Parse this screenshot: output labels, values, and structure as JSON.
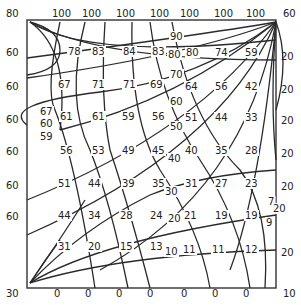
{
  "diagram": {
    "type": "contour-flow-net",
    "corners": {
      "top_left": "80",
      "top_right": "60",
      "bottom_left": "30",
      "bottom_right": "10"
    },
    "top_boundary": [
      "100",
      "100",
      "100",
      "100",
      "100",
      "100",
      "100"
    ],
    "bottom_boundary": [
      "0",
      "0",
      "0",
      "0",
      "0",
      "0",
      "0"
    ],
    "left_boundary": [
      "60",
      "60",
      "60",
      "60",
      "60",
      "60"
    ],
    "right_boundary": [
      "20",
      "20",
      "20",
      "20",
      "20",
      "20"
    ],
    "interior_labels": [
      {
        "t": "78",
        "x": 68,
        "y": 55
      },
      {
        "t": "83",
        "x": 92,
        "y": 55
      },
      {
        "t": "84",
        "x": 123,
        "y": 55
      },
      {
        "t": "83",
        "x": 152,
        "y": 55
      },
      {
        "t": "90",
        "x": 170,
        "y": 40
      },
      {
        "t": "80",
        "x": 168,
        "y": 58
      },
      {
        "t": "80",
        "x": 186,
        "y": 56
      },
      {
        "t": "74",
        "x": 215,
        "y": 56
      },
      {
        "t": "59",
        "x": 245,
        "y": 56
      },
      {
        "t": "67",
        "x": 58,
        "y": 88
      },
      {
        "t": "71",
        "x": 92,
        "y": 88
      },
      {
        "t": "71",
        "x": 123,
        "y": 88
      },
      {
        "t": "69",
        "x": 150,
        "y": 88
      },
      {
        "t": "70",
        "x": 170,
        "y": 78
      },
      {
        "t": "64",
        "x": 185,
        "y": 90
      },
      {
        "t": "56",
        "x": 215,
        "y": 90
      },
      {
        "t": "42",
        "x": 245,
        "y": 90
      },
      {
        "t": "67",
        "x": 40,
        "y": 115
      },
      {
        "t": "61",
        "x": 60,
        "y": 120
      },
      {
        "t": "61",
        "x": 92,
        "y": 120
      },
      {
        "t": "59",
        "x": 122,
        "y": 120
      },
      {
        "t": "56",
        "x": 152,
        "y": 120
      },
      {
        "t": "60",
        "x": 170,
        "y": 105
      },
      {
        "t": "51",
        "x": 185,
        "y": 121
      },
      {
        "t": "44",
        "x": 215,
        "y": 121
      },
      {
        "t": "33",
        "x": 245,
        "y": 121
      },
      {
        "t": "60",
        "x": 40,
        "y": 127
      },
      {
        "t": "59",
        "x": 40,
        "y": 140
      },
      {
        "t": "50",
        "x": 170,
        "y": 130
      },
      {
        "t": "56",
        "x": 60,
        "y": 154
      },
      {
        "t": "53",
        "x": 92,
        "y": 154
      },
      {
        "t": "49",
        "x": 122,
        "y": 154
      },
      {
        "t": "45",
        "x": 152,
        "y": 154
      },
      {
        "t": "40",
        "x": 185,
        "y": 154
      },
      {
        "t": "35",
        "x": 215,
        "y": 154
      },
      {
        "t": "28",
        "x": 245,
        "y": 154
      },
      {
        "t": "40",
        "x": 168,
        "y": 162
      },
      {
        "t": "51",
        "x": 58,
        "y": 187
      },
      {
        "t": "44",
        "x": 88,
        "y": 187
      },
      {
        "t": "39",
        "x": 122,
        "y": 187
      },
      {
        "t": "35",
        "x": 152,
        "y": 187
      },
      {
        "t": "31",
        "x": 185,
        "y": 187
      },
      {
        "t": "27",
        "x": 215,
        "y": 187
      },
      {
        "t": "23",
        "x": 245,
        "y": 187
      },
      {
        "t": "30",
        "x": 165,
        "y": 195
      },
      {
        "t": "7",
        "x": 268,
        "y": 205
      },
      {
        "t": "20",
        "x": 273,
        "y": 212
      },
      {
        "t": "44",
        "x": 58,
        "y": 219
      },
      {
        "t": "34",
        "x": 88,
        "y": 219
      },
      {
        "t": "28",
        "x": 120,
        "y": 219
      },
      {
        "t": "24",
        "x": 150,
        "y": 219
      },
      {
        "t": "20",
        "x": 168,
        "y": 222
      },
      {
        "t": "21",
        "x": 184,
        "y": 219
      },
      {
        "t": "19",
        "x": 215,
        "y": 219
      },
      {
        "t": "19",
        "x": 245,
        "y": 219
      },
      {
        "t": "9",
        "x": 266,
        "y": 226
      },
      {
        "t": "31",
        "x": 58,
        "y": 250
      },
      {
        "t": "20",
        "x": 88,
        "y": 250
      },
      {
        "t": "15",
        "x": 120,
        "y": 250
      },
      {
        "t": "13",
        "x": 150,
        "y": 250
      },
      {
        "t": "10",
        "x": 165,
        "y": 255
      },
      {
        "t": "11",
        "x": 183,
        "y": 253
      },
      {
        "t": "11",
        "x": 212,
        "y": 253
      },
      {
        "t": "12",
        "x": 245,
        "y": 253
      }
    ]
  }
}
